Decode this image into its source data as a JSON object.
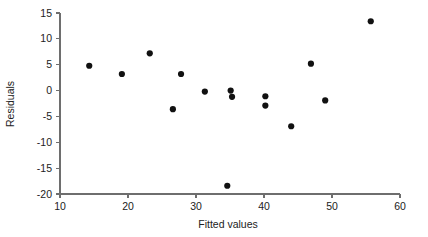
{
  "chart_data": {
    "type": "scatter",
    "title": "",
    "xlabel": "Fitted values",
    "ylabel": "Residuals",
    "xlim": [
      10,
      60
    ],
    "ylim": [
      -20,
      15
    ],
    "xticks": [
      10,
      20,
      30,
      40,
      50,
      60
    ],
    "yticks": [
      15,
      10,
      5,
      0,
      -5,
      -10,
      -15,
      -20
    ],
    "xtick_labels": [
      "10",
      "20",
      "30",
      "40",
      "50",
      "60"
    ],
    "ytick_labels": [
      "15",
      "10",
      "5",
      "0",
      "-5",
      "-10",
      "-15",
      "-20"
    ],
    "grid": false,
    "legend": null,
    "marker": "filled-circle",
    "marker_color": "#111111",
    "axis_color": "#6e6e6e",
    "background_color": "#ffffff",
    "points": [
      {
        "x": 14.3,
        "y": 4.8
      },
      {
        "x": 19.1,
        "y": 3.2
      },
      {
        "x": 23.2,
        "y": 7.2
      },
      {
        "x": 26.6,
        "y": -3.6
      },
      {
        "x": 27.8,
        "y": 3.2
      },
      {
        "x": 31.3,
        "y": -0.2
      },
      {
        "x": 34.6,
        "y": -18.4
      },
      {
        "x": 35.1,
        "y": 0.0
      },
      {
        "x": 35.3,
        "y": -1.2
      },
      {
        "x": 40.2,
        "y": -1.1
      },
      {
        "x": 40.2,
        "y": -2.9
      },
      {
        "x": 44.0,
        "y": -6.9
      },
      {
        "x": 46.9,
        "y": 5.2
      },
      {
        "x": 49.0,
        "y": -1.9
      },
      {
        "x": 55.7,
        "y": 13.4
      }
    ],
    "series": [
      {
        "name": "residuals",
        "x": [
          14.3,
          19.1,
          23.2,
          26.6,
          27.8,
          31.3,
          34.6,
          35.1,
          35.3,
          40.2,
          40.2,
          44.0,
          46.9,
          49.0,
          55.7
        ],
        "values": [
          4.8,
          3.2,
          7.2,
          -3.6,
          3.2,
          -0.2,
          -18.4,
          0.0,
          -1.2,
          -1.1,
          -2.9,
          -6.9,
          5.2,
          -1.9,
          13.4
        ]
      }
    ]
  },
  "layout": {
    "plot_left_px": 60,
    "plot_right_px": 400,
    "plot_top_px": 13,
    "plot_bottom_px": 194,
    "marker_radius_px": 3.1
  }
}
